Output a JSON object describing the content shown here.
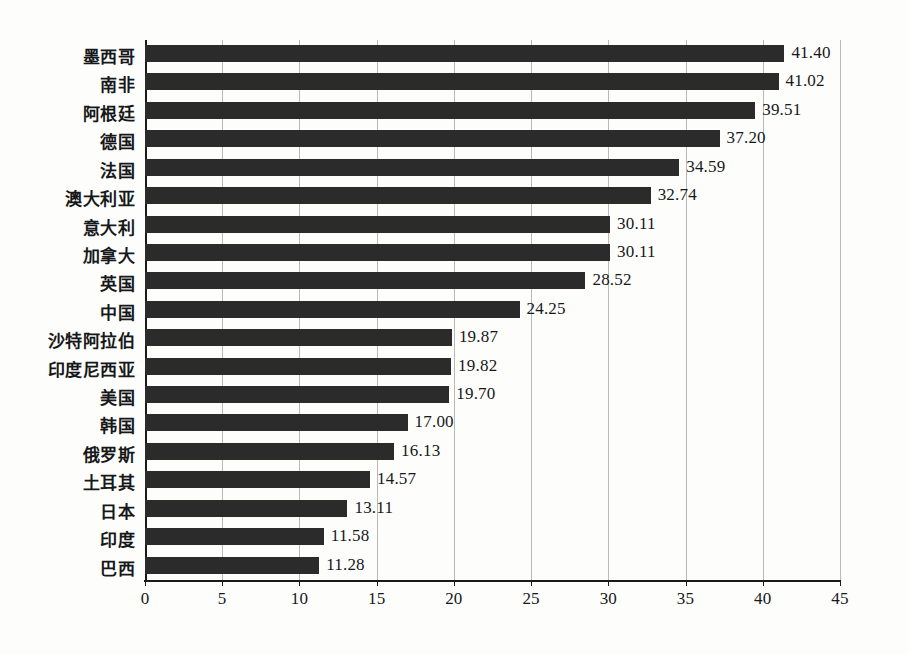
{
  "chart_data": {
    "type": "bar",
    "orientation": "horizontal",
    "title": "",
    "subtitle": "",
    "xlabel": "",
    "ylabel": "",
    "xlim": [
      0,
      45
    ],
    "ylim": null,
    "xticks": [
      0,
      5,
      10,
      15,
      20,
      25,
      30,
      35,
      40,
      45
    ],
    "xtick_labels": [
      "0",
      "5",
      "10",
      "15",
      "20",
      "25",
      "30",
      "35",
      "40",
      "45"
    ],
    "grid": "vertical",
    "legend": null,
    "legend_position": "none",
    "bar_color": "#2b2b2b",
    "gridline_color": "#b9b9b9",
    "axis_color": "#1a1a1a",
    "background_color": "#ffffff",
    "value_label_format": "0.00",
    "categories": [
      "墨西哥",
      "南非",
      "阿根廷",
      "德国",
      "法国",
      "澳大利亚",
      "意大利",
      "加拿大",
      "英国",
      "中国",
      "沙特阿拉伯",
      "印度尼西亚",
      "美国",
      "韩国",
      "俄罗斯",
      "土耳其",
      "日本",
      "印度",
      "巴西"
    ],
    "values": [
      41.4,
      41.02,
      39.51,
      37.2,
      34.59,
      32.74,
      30.11,
      30.11,
      28.52,
      24.25,
      19.87,
      19.82,
      19.7,
      17.0,
      16.13,
      14.57,
      13.11,
      11.58,
      11.28
    ],
    "value_labels": [
      "41.40",
      "41.02",
      "39.51",
      "37.20",
      "34.59",
      "32.74",
      "30.11",
      "30.11",
      "28.52",
      "24.25",
      "19.87",
      "19.82",
      "19.70",
      "17.00",
      "16.13",
      "14.57",
      "13.11",
      "11.58",
      "11.28"
    ]
  }
}
